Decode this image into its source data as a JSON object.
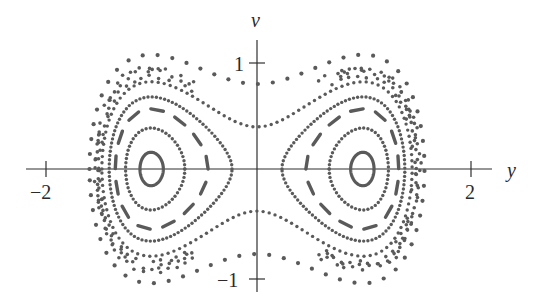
{
  "chart_data": {
    "type": "scatter",
    "title": "",
    "subtitle": "Phase portrait (Poincaré-style) of a double-well oscillator",
    "xlabel": "y",
    "ylabel": "v",
    "xlim": [
      -2.2,
      2.5
    ],
    "ylim": [
      -1.3,
      1.5
    ],
    "grid": false,
    "legend": "none",
    "x_ticks": [
      {
        "value": -2,
        "label": "−2"
      },
      {
        "value": 2,
        "label": "2"
      }
    ],
    "y_ticks": [
      {
        "value": 1,
        "label": "1"
      },
      {
        "value": -1,
        "label": "−1"
      }
    ],
    "equilibria": [
      {
        "y": -1,
        "v": 0
      },
      {
        "y": 1,
        "v": 0
      }
    ],
    "series": [
      {
        "name": "small-ellipse-left",
        "style": "solid",
        "center": [
          -1,
          0
        ],
        "energy": -0.238,
        "side": "left"
      },
      {
        "name": "small-ellipse-right",
        "style": "solid",
        "center": [
          1,
          0
        ],
        "energy": -0.238,
        "side": "right"
      },
      {
        "name": "orbit-inner",
        "style": "dense-dots",
        "energy": -0.178,
        "sides": [
          "left",
          "right"
        ]
      },
      {
        "name": "orbit-dashed",
        "style": "dashes",
        "energy": -0.095,
        "sides": [
          "left",
          "right"
        ]
      },
      {
        "name": "orbit-near-separatrix",
        "style": "dense-dots",
        "energy": -0.027,
        "sides": [
          "left",
          "right"
        ]
      },
      {
        "name": "orbit-peanut",
        "style": "dots",
        "energy": 0.076,
        "v_at_y0": 0.39
      },
      {
        "name": "chaotic-band",
        "style": "scattered",
        "energy_range": [
          0.12,
          0.2
        ]
      },
      {
        "name": "orbit-outer",
        "style": "sparse-dots",
        "energy": 0.31,
        "v_at_y0": 0.79
      }
    ]
  },
  "axes": {
    "x_label": "y",
    "y_label": "v",
    "tick_labels": {
      "x_neg2": "−2",
      "x_pos2": "2",
      "y_pos1": "1",
      "y_neg1": "−1"
    }
  },
  "colors": {
    "dots": "#5a5a5a",
    "axes": "#2f2f2f",
    "background": "#ffffff"
  }
}
